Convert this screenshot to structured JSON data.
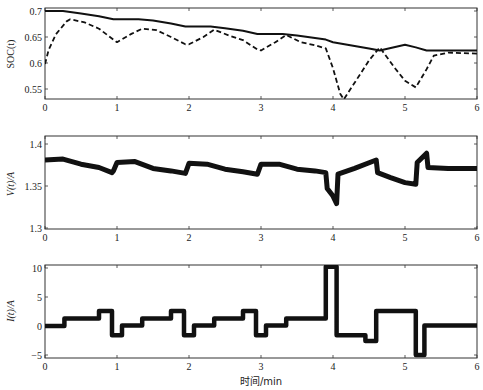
{
  "chart_data": [
    {
      "type": "line",
      "title": "",
      "xlabel": "",
      "ylabel": "SOC(t)",
      "xlim": [
        0,
        6
      ],
      "ylim": [
        0.53,
        0.706
      ],
      "xticks": [
        "0",
        "1",
        "2",
        "3",
        "4",
        "5",
        "6"
      ],
      "yticks": [
        "0.55",
        "0.6",
        "0.65",
        "0.7"
      ],
      "grid": false,
      "series": [
        {
          "name": "true SOC",
          "style": "solid",
          "x": [
            0,
            0.25,
            0.5,
            0.75,
            0.95,
            1.0,
            1.3,
            1.5,
            1.75,
            1.95,
            2.0,
            2.3,
            2.5,
            2.75,
            2.95,
            3.0,
            3.3,
            3.5,
            3.75,
            3.9,
            4.0,
            4.5,
            4.65,
            5.0,
            5.15,
            5.3,
            5.6,
            6.0
          ],
          "values": [
            0.7,
            0.7,
            0.695,
            0.69,
            0.684,
            0.684,
            0.684,
            0.682,
            0.676,
            0.67,
            0.67,
            0.67,
            0.667,
            0.662,
            0.656,
            0.656,
            0.656,
            0.653,
            0.648,
            0.645,
            0.64,
            0.628,
            0.624,
            0.635,
            0.63,
            0.624,
            0.624,
            0.624
          ]
        },
        {
          "name": "estimated SOC",
          "style": "dashed",
          "x": [
            0,
            0.05,
            0.15,
            0.3,
            0.35,
            0.55,
            0.75,
            0.95,
            1.0,
            1.2,
            1.35,
            1.55,
            1.75,
            1.95,
            2.0,
            2.2,
            2.35,
            2.55,
            2.75,
            2.95,
            3.0,
            3.2,
            3.35,
            3.55,
            3.75,
            3.9,
            4.0,
            4.1,
            4.15,
            4.3,
            4.5,
            4.65,
            4.85,
            5.0,
            5.15,
            5.3,
            5.4,
            5.6,
            6.0
          ],
          "values": [
            0.598,
            0.625,
            0.655,
            0.68,
            0.684,
            0.678,
            0.666,
            0.645,
            0.64,
            0.656,
            0.666,
            0.663,
            0.65,
            0.636,
            0.636,
            0.65,
            0.664,
            0.653,
            0.644,
            0.626,
            0.624,
            0.64,
            0.654,
            0.64,
            0.634,
            0.628,
            0.59,
            0.541,
            0.53,
            0.562,
            0.605,
            0.63,
            0.592,
            0.566,
            0.553,
            0.588,
            0.614,
            0.62,
            0.618
          ]
        }
      ]
    },
    {
      "type": "line",
      "title": "",
      "xlabel": "",
      "ylabel": "V(t)/A",
      "xlim": [
        0,
        6
      ],
      "ylim": [
        1.3,
        1.41
      ],
      "xticks": [
        "0",
        "1",
        "2",
        "3",
        "4",
        "5",
        "6"
      ],
      "yticks": [
        "1.3",
        "1.35",
        "1.4"
      ],
      "grid": false,
      "series": [
        {
          "name": "terminal voltage",
          "style": "solid-thick",
          "x": [
            0,
            0.25,
            0.5,
            0.75,
            0.93,
            0.95,
            1.0,
            1.25,
            1.5,
            1.75,
            1.95,
            2.0,
            2.25,
            2.5,
            2.75,
            2.95,
            3.0,
            3.25,
            3.5,
            3.75,
            3.9,
            3.92,
            4.0,
            4.05,
            4.07,
            4.3,
            4.6,
            4.62,
            4.8,
            5.0,
            5.15,
            5.17,
            5.3,
            5.32,
            5.6,
            6.0
          ],
          "values": [
            1.381,
            1.382,
            1.376,
            1.372,
            1.366,
            1.368,
            1.378,
            1.379,
            1.371,
            1.368,
            1.365,
            1.377,
            1.376,
            1.37,
            1.367,
            1.364,
            1.376,
            1.376,
            1.37,
            1.368,
            1.366,
            1.347,
            1.338,
            1.329,
            1.364,
            1.371,
            1.381,
            1.366,
            1.36,
            1.354,
            1.352,
            1.378,
            1.389,
            1.372,
            1.371,
            1.371
          ]
        }
      ]
    },
    {
      "type": "line",
      "title": "",
      "xlabel": "时间/min",
      "ylabel": "I(t)/A",
      "xlim": [
        0,
        6
      ],
      "ylim": [
        -5.5,
        10.5
      ],
      "xticks": [
        "0",
        "1",
        "2",
        "3",
        "4",
        "5",
        "6"
      ],
      "yticks": [
        "-5",
        "0",
        "5",
        "10"
      ],
      "grid": false,
      "series": [
        {
          "name": "current",
          "style": "step-thick",
          "x": [
            0,
            0.27,
            0.27,
            0.75,
            0.75,
            0.93,
            0.93,
            1.07,
            1.07,
            1.35,
            1.35,
            1.75,
            1.75,
            1.93,
            1.93,
            2.07,
            2.07,
            2.35,
            2.35,
            2.75,
            2.75,
            2.93,
            2.93,
            3.07,
            3.07,
            3.35,
            3.35,
            3.9,
            3.9,
            4.05,
            4.05,
            4.45,
            4.45,
            4.6,
            4.6,
            5.15,
            5.15,
            5.27,
            5.27,
            6.0
          ],
          "values": [
            0,
            0,
            1.3,
            1.3,
            2.6,
            2.6,
            -1.6,
            -1.6,
            0.1,
            0.1,
            1.3,
            1.3,
            2.6,
            2.6,
            -1.6,
            -1.6,
            0.1,
            0.1,
            1.3,
            1.3,
            2.6,
            2.6,
            -1.6,
            -1.6,
            0.1,
            0.1,
            1.3,
            1.3,
            10.2,
            10.2,
            -1.6,
            -1.6,
            -2.6,
            -2.6,
            2.6,
            2.6,
            -5.0,
            -5.0,
            0.1,
            0.1
          ]
        }
      ]
    }
  ],
  "labels": {
    "soc_ylabel": "SOC(t)",
    "v_ylabel": "V(t)/A",
    "i_ylabel": "I(t)/A",
    "xlabel": "时间/min"
  }
}
